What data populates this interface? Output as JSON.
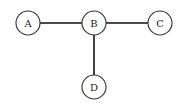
{
  "diagram": {
    "type": "graph",
    "nodes": [
      {
        "id": "A",
        "label": "A",
        "x": 28,
        "y": 23
      },
      {
        "id": "B",
        "label": "B",
        "x": 94,
        "y": 23
      },
      {
        "id": "C",
        "label": "C",
        "x": 160,
        "y": 23
      },
      {
        "id": "D",
        "label": "D",
        "x": 94,
        "y": 87
      }
    ],
    "edges": [
      {
        "from": "A",
        "to": "B"
      },
      {
        "from": "B",
        "to": "C"
      },
      {
        "from": "B",
        "to": "D"
      }
    ]
  }
}
